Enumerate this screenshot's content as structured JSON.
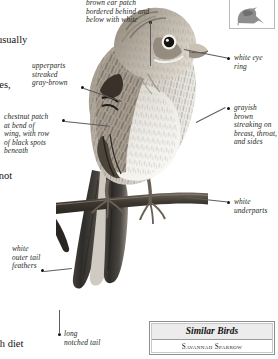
{
  "page": {
    "background": "#ffffff",
    "ink": "#231f1c"
  },
  "body_text": {
    "lines": [
      "ay it usually",
      "noruses,",
      "r",
      "ng is not",
      ", for",
      "ghout",
      "able",
      "",
      "er"
    ],
    "bottom_fragment": "ough diet"
  },
  "silhouette": {
    "icon": "perched-bird-silhouette-icon"
  },
  "callouts": [
    {
      "id": "ear-patch",
      "text": "brown ear patch\nbordered behind and\nbelow with white",
      "side": "top"
    },
    {
      "id": "upperparts",
      "text": "upperparts\nstreaked\ngray-brown",
      "side": "left"
    },
    {
      "id": "chestnut-patch",
      "text": "chestnut patch\nat bend of\nwing, with row\nof black spots\nbeneath",
      "side": "left"
    },
    {
      "id": "white-eye-ring",
      "text": "white eye\nring",
      "side": "right"
    },
    {
      "id": "grayish-brown-streaking",
      "text": "grayish\nbrown\nstreaking on\nbreast, throat,\nand sides",
      "side": "right"
    },
    {
      "id": "white-underparts",
      "text": "white\nunderparts",
      "side": "right"
    },
    {
      "id": "white-outer-tail-feathers",
      "text": "white\nouter tail\nfeathers",
      "side": "left"
    },
    {
      "id": "long-notched-tail",
      "text": "long\nnotched tail",
      "side": "left"
    }
  ],
  "similar_birds": {
    "title": "Similar Birds",
    "species": [
      "Savannah Sparrow"
    ]
  }
}
